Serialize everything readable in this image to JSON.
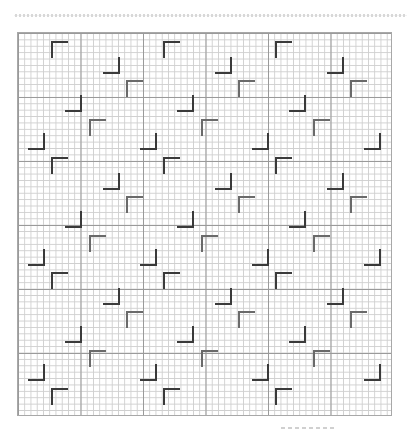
{
  "canvas": {
    "width": 407,
    "height": 435
  },
  "grid": {
    "left": 17,
    "top": 32,
    "width": 375,
    "height": 384,
    "major_cols": 6,
    "major_rows": 6,
    "minor_per_major": 10,
    "minor_color": "#cfcfcf",
    "major_color": "#9a9a9a"
  },
  "marks": {
    "arm_length": 17,
    "period_x": 112,
    "period_y": 115.5,
    "dark_color": "#3a3a3a",
    "light_color": "#6a6a6a",
    "motif": [
      {
        "type": "tl",
        "x": 51,
        "y": 41,
        "shade": "dark"
      },
      {
        "type": "br",
        "x": 120,
        "y": 74,
        "shade": "dark"
      },
      {
        "type": "tl",
        "x": 126,
        "y": 80,
        "shade": "light"
      },
      {
        "type": "br",
        "x": 82,
        "y": 112,
        "shade": "dark"
      },
      {
        "type": "tl",
        "x": 89,
        "y": 119,
        "shade": "light"
      },
      {
        "type": "br",
        "x": 45,
        "y": 150,
        "shade": "dark"
      }
    ]
  }
}
